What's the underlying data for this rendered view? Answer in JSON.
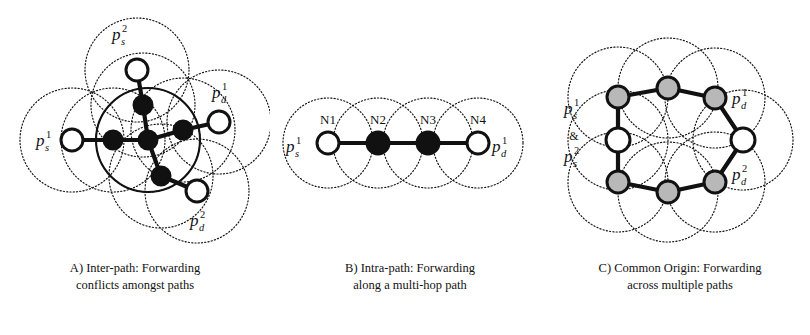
{
  "figure": {
    "type": "diagram",
    "background": "#ffffff",
    "ink_color": "#111111",
    "node_fill_active": "#111111",
    "node_fill_idle": "#ffffff",
    "node_fill_shared": "#b8b8b8",
    "range_circle_style": "dotted"
  },
  "panels": [
    {
      "id": "A",
      "caption_line1": "A) Inter-path: Forwarding",
      "caption_line2": "conflicts amongst paths",
      "labels": [
        {
          "name": "source-1-label",
          "base": "p",
          "sub": "s",
          "sup": "1",
          "x": 36,
          "y": 146
        },
        {
          "name": "source-2-label",
          "base": "p",
          "sub": "s",
          "sup": "2",
          "x": 112,
          "y": 40
        },
        {
          "name": "dest-1-label",
          "base": "p",
          "sub": "d",
          "sup": "1",
          "x": 212,
          "y": 98
        },
        {
          "name": "dest-2-label",
          "base": "p",
          "sub": "d",
          "sup": "2",
          "x": 190,
          "y": 226
        }
      ],
      "nodes": [
        {
          "name": "node-s1",
          "kind": "idle",
          "x": 72,
          "y": 140,
          "r": 11
        },
        {
          "name": "node-a1",
          "kind": "active",
          "x": 113,
          "y": 140,
          "r": 9
        },
        {
          "name": "node-center",
          "kind": "active",
          "x": 148,
          "y": 140,
          "r": 9
        },
        {
          "name": "node-s2",
          "kind": "idle",
          "x": 137,
          "y": 70,
          "r": 11
        },
        {
          "name": "node-a2",
          "kind": "active",
          "x": 143,
          "y": 105,
          "r": 9
        },
        {
          "name": "node-a3",
          "kind": "active",
          "x": 183,
          "y": 130,
          "r": 9
        },
        {
          "name": "node-d1",
          "kind": "idle",
          "x": 219,
          "y": 122,
          "r": 11
        },
        {
          "name": "node-a4",
          "kind": "active",
          "x": 161,
          "y": 176,
          "r": 9
        },
        {
          "name": "node-d2",
          "kind": "idle",
          "x": 197,
          "y": 191,
          "r": 11
        }
      ],
      "links": [
        [
          72,
          140,
          113,
          140
        ],
        [
          113,
          140,
          148,
          140
        ],
        [
          148,
          140,
          183,
          130
        ],
        [
          183,
          130,
          219,
          122
        ],
        [
          137,
          70,
          143,
          105
        ],
        [
          143,
          105,
          148,
          140
        ],
        [
          148,
          140,
          161,
          176
        ],
        [
          161,
          176,
          197,
          191
        ]
      ],
      "ranges": [
        {
          "x": 72,
          "y": 140,
          "r": 52
        },
        {
          "x": 113,
          "y": 140,
          "r": 52
        },
        {
          "x": 148,
          "y": 140,
          "r": 52
        },
        {
          "x": 137,
          "y": 70,
          "r": 52
        },
        {
          "x": 143,
          "y": 105,
          "r": 52
        },
        {
          "x": 183,
          "y": 130,
          "r": 52
        },
        {
          "x": 219,
          "y": 122,
          "r": 52
        },
        {
          "x": 161,
          "y": 176,
          "r": 52
        },
        {
          "x": 197,
          "y": 191,
          "r": 52
        }
      ],
      "solid_range": {
        "x": 148,
        "y": 140,
        "r": 52
      }
    },
    {
      "id": "B",
      "caption_line1": "B) Intra-path: Forwarding",
      "caption_line2": "along a multi-hop path",
      "labels": [
        {
          "name": "source-1-label",
          "base": "p",
          "sub": "s",
          "sup": "1",
          "x": 16,
          "y": 152
        },
        {
          "name": "dest-1-label",
          "base": "p",
          "sub": "d",
          "sup": "1",
          "x": 222,
          "y": 152
        }
      ],
      "node_labels": [
        "N1",
        "N2",
        "N3",
        "N4"
      ],
      "nodes": [
        {
          "name": "node-n1",
          "kind": "idle",
          "x": 58,
          "y": 143,
          "r": 11,
          "label": "N1"
        },
        {
          "name": "node-n2",
          "kind": "active",
          "x": 108,
          "y": 143,
          "r": 11,
          "label": "N2"
        },
        {
          "name": "node-n3",
          "kind": "active",
          "x": 158,
          "y": 143,
          "r": 11,
          "label": "N3"
        },
        {
          "name": "node-n4",
          "kind": "idle",
          "x": 208,
          "y": 143,
          "r": 11,
          "label": "N4"
        }
      ],
      "links": [
        [
          58,
          143,
          108,
          143
        ],
        [
          108,
          143,
          158,
          143
        ],
        [
          158,
          143,
          208,
          143
        ]
      ],
      "ranges": [
        {
          "x": 58,
          "y": 143,
          "r": 45
        },
        {
          "x": 108,
          "y": 143,
          "r": 45
        },
        {
          "x": 158,
          "y": 143,
          "r": 45
        },
        {
          "x": 208,
          "y": 143,
          "r": 45
        }
      ]
    },
    {
      "id": "C",
      "caption_line1": "C) Common Origin: Forwarding",
      "caption_line2": "across multiple paths",
      "labels": [
        {
          "name": "source-1-label",
          "base": "p",
          "sub": "s",
          "sup": "1",
          "x": 14,
          "y": 114
        },
        {
          "name": "source-2-label",
          "base": "p",
          "sub": "s",
          "sup": "2",
          "x": 14,
          "y": 162
        },
        {
          "name": "dest-1-label",
          "base": "p",
          "sub": "d",
          "sup": "1",
          "x": 182,
          "y": 104
        },
        {
          "name": "dest-2-label",
          "base": "p",
          "sub": "d",
          "sup": "2",
          "x": 182,
          "y": 180
        }
      ],
      "conjunction": "&",
      "conjunction_pos": {
        "x": 24,
        "y": 140
      },
      "nodes": [
        {
          "name": "node-origin",
          "kind": "idle",
          "x": 68,
          "y": 140,
          "r": 12
        },
        {
          "name": "node-up-left",
          "kind": "shared",
          "x": 68,
          "y": 97,
          "r": 11
        },
        {
          "name": "node-up-mid",
          "kind": "shared",
          "x": 118,
          "y": 88,
          "r": 11
        },
        {
          "name": "node-up-right",
          "kind": "shared",
          "x": 165,
          "y": 98,
          "r": 11
        },
        {
          "name": "node-dest",
          "kind": "idle",
          "x": 193,
          "y": 140,
          "r": 12
        },
        {
          "name": "node-down-right",
          "kind": "shared",
          "x": 165,
          "y": 182,
          "r": 11
        },
        {
          "name": "node-down-mid",
          "kind": "shared",
          "x": 118,
          "y": 192,
          "r": 11
        },
        {
          "name": "node-down-left",
          "kind": "shared",
          "x": 68,
          "y": 182,
          "r": 11
        }
      ],
      "links": [
        [
          68,
          140,
          68,
          97
        ],
        [
          68,
          97,
          118,
          88
        ],
        [
          118,
          88,
          165,
          98
        ],
        [
          165,
          98,
          193,
          140
        ],
        [
          68,
          140,
          68,
          182
        ],
        [
          68,
          182,
          118,
          192
        ],
        [
          118,
          192,
          165,
          182
        ],
        [
          165,
          182,
          193,
          140
        ]
      ],
      "ranges": [
        {
          "x": 68,
          "y": 140,
          "r": 50
        },
        {
          "x": 68,
          "y": 97,
          "r": 50
        },
        {
          "x": 118,
          "y": 88,
          "r": 50
        },
        {
          "x": 165,
          "y": 98,
          "r": 50
        },
        {
          "x": 193,
          "y": 140,
          "r": 50
        },
        {
          "x": 165,
          "y": 182,
          "r": 50
        },
        {
          "x": 118,
          "y": 192,
          "r": 50
        },
        {
          "x": 68,
          "y": 182,
          "r": 50
        }
      ]
    }
  ]
}
